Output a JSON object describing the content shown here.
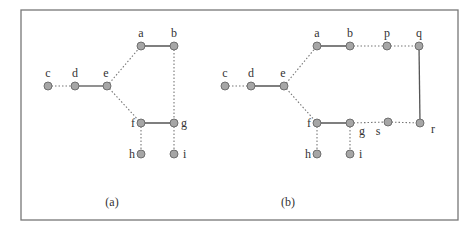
{
  "frame": {
    "x": 21,
    "y": 10,
    "width": 437,
    "height": 210
  },
  "subfigures": [
    {
      "caption": "(a)",
      "caption_pos": [
        112,
        206
      ],
      "nodes": [
        {
          "id": "c",
          "x": 48,
          "y": 86,
          "lx": 48,
          "ly": 77,
          "anchor": "middle"
        },
        {
          "id": "d",
          "x": 75,
          "y": 86,
          "lx": 75,
          "ly": 77,
          "anchor": "middle"
        },
        {
          "id": "e",
          "x": 107,
          "y": 86,
          "lx": 106,
          "ly": 77,
          "anchor": "middle"
        },
        {
          "id": "a",
          "x": 141,
          "y": 46,
          "lx": 141,
          "ly": 37,
          "anchor": "middle"
        },
        {
          "id": "b",
          "x": 174,
          "y": 46,
          "lx": 174,
          "ly": 37,
          "anchor": "middle"
        },
        {
          "id": "f",
          "x": 141,
          "y": 123,
          "lx": 135,
          "ly": 127,
          "anchor": "end"
        },
        {
          "id": "g",
          "x": 174,
          "y": 123,
          "lx": 181,
          "ly": 127,
          "anchor": "start"
        },
        {
          "id": "h",
          "x": 141,
          "y": 154,
          "lx": 135,
          "ly": 158,
          "anchor": "end"
        },
        {
          "id": "i",
          "x": 174,
          "y": 154,
          "lx": 183,
          "ly": 158,
          "anchor": "start"
        }
      ],
      "edges": [
        {
          "from": "c",
          "to": "d",
          "style": "dotted"
        },
        {
          "from": "d",
          "to": "e",
          "style": "solid"
        },
        {
          "from": "e",
          "to": "a",
          "style": "dotted"
        },
        {
          "from": "e",
          "to": "f",
          "style": "dotted"
        },
        {
          "from": "a",
          "to": "b",
          "style": "solid"
        },
        {
          "from": "b",
          "to": "g",
          "style": "dotted"
        },
        {
          "from": "f",
          "to": "g",
          "style": "solid"
        },
        {
          "from": "f",
          "to": "h",
          "style": "dotted"
        },
        {
          "from": "g",
          "to": "i",
          "style": "dotted"
        }
      ]
    },
    {
      "caption": "(b)",
      "caption_pos": [
        288,
        206
      ],
      "nodes": [
        {
          "id": "c",
          "x": 225,
          "y": 86,
          "lx": 225,
          "ly": 77,
          "anchor": "middle"
        },
        {
          "id": "d",
          "x": 251,
          "y": 86,
          "lx": 251,
          "ly": 77,
          "anchor": "middle"
        },
        {
          "id": "e",
          "x": 284,
          "y": 86,
          "lx": 283,
          "ly": 77,
          "anchor": "middle"
        },
        {
          "id": "a",
          "x": 317,
          "y": 46,
          "lx": 317,
          "ly": 37,
          "anchor": "middle"
        },
        {
          "id": "b",
          "x": 350,
          "y": 46,
          "lx": 350,
          "ly": 37,
          "anchor": "middle"
        },
        {
          "id": "p",
          "x": 387,
          "y": 46,
          "lx": 387,
          "ly": 37,
          "anchor": "middle"
        },
        {
          "id": "q",
          "x": 419,
          "y": 46,
          "lx": 419,
          "ly": 37,
          "anchor": "middle"
        },
        {
          "id": "f",
          "x": 317,
          "y": 123,
          "lx": 311,
          "ly": 127,
          "anchor": "end"
        },
        {
          "id": "g",
          "x": 350,
          "y": 123,
          "lx": 362,
          "ly": 135,
          "anchor": "middle"
        },
        {
          "id": "s",
          "x": 388,
          "y": 122,
          "lx": 378,
          "ly": 135,
          "anchor": "middle"
        },
        {
          "id": "r",
          "x": 420,
          "y": 123,
          "lx": 433,
          "ly": 133,
          "anchor": "middle"
        },
        {
          "id": "h",
          "x": 317,
          "y": 154,
          "lx": 311,
          "ly": 158,
          "anchor": "end"
        },
        {
          "id": "i",
          "x": 350,
          "y": 154,
          "lx": 359,
          "ly": 158,
          "anchor": "start"
        }
      ],
      "edges": [
        {
          "from": "c",
          "to": "d",
          "style": "dotted"
        },
        {
          "from": "d",
          "to": "e",
          "style": "solid"
        },
        {
          "from": "e",
          "to": "a",
          "style": "dotted"
        },
        {
          "from": "e",
          "to": "f",
          "style": "dotted"
        },
        {
          "from": "a",
          "to": "b",
          "style": "solid"
        },
        {
          "from": "b",
          "to": "p",
          "style": "dotted"
        },
        {
          "from": "p",
          "to": "q",
          "style": "dotted"
        },
        {
          "from": "q",
          "to": "r",
          "style": "solid"
        },
        {
          "from": "f",
          "to": "g",
          "style": "solid"
        },
        {
          "from": "g",
          "to": "s",
          "style": "dotted"
        },
        {
          "from": "s",
          "to": "r",
          "style": "dotted"
        },
        {
          "from": "f",
          "to": "h",
          "style": "dotted"
        },
        {
          "from": "g",
          "to": "i",
          "style": "dotted"
        }
      ]
    }
  ]
}
